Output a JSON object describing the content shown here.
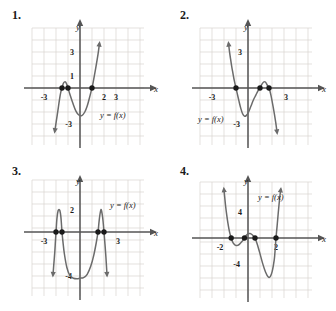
{
  "page": {
    "background": "#ffffff",
    "curve_color": "#6b6b6b",
    "grid_color": "#d9d4d0",
    "axis_color": "#555555",
    "dot_color": "#1a1a1a",
    "text_color": "#1a1a1a"
  },
  "problems": [
    {
      "id": "1",
      "number": "1.",
      "y_axis_label": "y",
      "x_axis_label": "x",
      "function_label": "y = f(x)",
      "x_tick_labels": [
        "-3",
        "2",
        "3"
      ],
      "y_tick_labels": [
        "3",
        "1",
        "-3"
      ],
      "chart_data": {
        "type": "line",
        "title": "Problem 1 polynomial graph",
        "xlabel": "x",
        "ylabel": "y",
        "xlim": [
          -4,
          4
        ],
        "ylim": [
          -4,
          4
        ],
        "grid": true,
        "x_ticks": [
          -3,
          2,
          3
        ],
        "y_ticks": [
          3,
          1,
          -3
        ],
        "zeros": [
          -1.5,
          -1,
          1
        ],
        "zero_marker_count": 3,
        "local_max": {
          "x": -1.25,
          "y": 0.55
        },
        "local_min": {
          "x": 0.1,
          "y": -2.3
        },
        "end_behavior": {
          "left": "down",
          "right": "up"
        },
        "degree": 3,
        "series": [
          {
            "name": "f",
            "points": [
              [
                -2.1,
                -3.6
              ],
              [
                -1.95,
                -2.6
              ],
              [
                -1.8,
                -1.6
              ],
              [
                -1.7,
                -0.9
              ],
              [
                -1.6,
                -0.35
              ],
              [
                -1.5,
                0.0
              ],
              [
                -1.4,
                0.35
              ],
              [
                -1.3,
                0.5
              ],
              [
                -1.2,
                0.5
              ],
              [
                -1.1,
                0.3
              ],
              [
                -1.0,
                0.0
              ],
              [
                -0.85,
                -0.5
              ],
              [
                -0.6,
                -1.25
              ],
              [
                -0.35,
                -1.9
              ],
              [
                -0.1,
                -2.25
              ],
              [
                0.15,
                -2.3
              ],
              [
                0.4,
                -2.0
              ],
              [
                0.6,
                -1.5
              ],
              [
                0.78,
                -0.85
              ],
              [
                0.92,
                -0.3
              ],
              [
                1.0,
                0.0
              ],
              [
                1.12,
                0.6
              ],
              [
                1.3,
                1.6
              ],
              [
                1.5,
                2.8
              ],
              [
                1.62,
                3.7
              ]
            ]
          }
        ]
      }
    },
    {
      "id": "2",
      "number": "2.",
      "y_axis_label": "y",
      "x_axis_label": "x",
      "function_label": "y = f(x)",
      "x_tick_labels": [
        "-3",
        "3"
      ],
      "y_tick_labels": [
        "3",
        "-3"
      ],
      "chart_data": {
        "type": "line",
        "title": "Problem 2 polynomial graph",
        "xlabel": "x",
        "ylabel": "y",
        "xlim": [
          -4,
          4
        ],
        "ylim": [
          -4,
          4
        ],
        "grid": true,
        "x_ticks": [
          -3,
          3
        ],
        "y_ticks": [
          3,
          -3
        ],
        "zeros": [
          -1,
          1,
          1.75
        ],
        "zero_marker_count": 3,
        "local_min": {
          "x": -0.25,
          "y": -2.35
        },
        "local_max": {
          "x": 1.4,
          "y": 0.55
        },
        "end_behavior": {
          "left": "up",
          "right": "down"
        },
        "degree": 3,
        "series": [
          {
            "name": "f",
            "points": [
              [
                -1.62,
                3.7
              ],
              [
                -1.55,
                3.1
              ],
              [
                -1.45,
                2.4
              ],
              [
                -1.35,
                1.75
              ],
              [
                -1.25,
                1.2
              ],
              [
                -1.15,
                0.65
              ],
              [
                -1.05,
                0.2
              ],
              [
                -1.0,
                0.0
              ],
              [
                -0.9,
                -0.45
              ],
              [
                -0.75,
                -1.1
              ],
              [
                -0.6,
                -1.7
              ],
              [
                -0.45,
                -2.15
              ],
              [
                -0.3,
                -2.35
              ],
              [
                -0.15,
                -2.3
              ],
              [
                0.05,
                -2.0
              ],
              [
                0.25,
                -1.5
              ],
              [
                0.45,
                -1.0
              ],
              [
                0.65,
                -0.6
              ],
              [
                0.85,
                -0.2
              ],
              [
                1.0,
                0.0
              ],
              [
                1.15,
                0.3
              ],
              [
                1.3,
                0.5
              ],
              [
                1.45,
                0.5
              ],
              [
                1.6,
                0.25
              ],
              [
                1.75,
                0.0
              ],
              [
                1.9,
                -0.55
              ],
              [
                2.1,
                -1.6
              ],
              [
                2.3,
                -2.8
              ],
              [
                2.42,
                -3.7
              ]
            ]
          }
        ]
      }
    },
    {
      "id": "3",
      "number": "3.",
      "y_axis_label": "y",
      "x_axis_label": "x",
      "function_label": "y = f(x)",
      "x_tick_labels": [
        "-3",
        "3"
      ],
      "y_tick_labels": [
        "2",
        "-4"
      ],
      "chart_data": {
        "type": "line",
        "title": "Problem 3 quartic W-shaped graph",
        "xlabel": "x",
        "ylabel": "y",
        "xlim": [
          -4,
          4
        ],
        "ylim": [
          -5,
          4
        ],
        "grid": true,
        "x_ticks": [
          -3,
          3
        ],
        "y_ticks": [
          2,
          -4
        ],
        "zeros": [
          -2,
          -1.5,
          1.5,
          2
        ],
        "zero_marker_count": 4,
        "local_max_left": {
          "x": -1.75,
          "y": 2.0
        },
        "local_max_right": {
          "x": 1.75,
          "y": 2.0
        },
        "local_min_center": {
          "x": 0,
          "y": -4.0
        },
        "end_behavior": {
          "left": "down",
          "right": "down"
        },
        "degree": 4,
        "series": [
          {
            "name": "f",
            "points": [
              [
                -2.25,
                -3.9
              ],
              [
                -2.18,
                -2.9
              ],
              [
                -2.1,
                -1.8
              ],
              [
                -2.05,
                -0.9
              ],
              [
                -2.0,
                0.0
              ],
              [
                -1.95,
                0.85
              ],
              [
                -1.9,
                1.45
              ],
              [
                -1.82,
                1.95
              ],
              [
                -1.75,
                2.05
              ],
              [
                -1.68,
                1.95
              ],
              [
                -1.6,
                1.45
              ],
              [
                -1.55,
                0.8
              ],
              [
                -1.5,
                0.0
              ],
              [
                -1.42,
                -0.9
              ],
              [
                -1.3,
                -2.0
              ],
              [
                -1.1,
                -3.2
              ],
              [
                -0.85,
                -3.95
              ],
              [
                -0.55,
                -4.2
              ],
              [
                -0.25,
                -4.25
              ],
              [
                0.0,
                -4.2
              ],
              [
                0.3,
                -4.15
              ],
              [
                0.6,
                -3.85
              ],
              [
                0.9,
                -3.1
              ],
              [
                1.15,
                -2.1
              ],
              [
                1.35,
                -1.0
              ],
              [
                1.5,
                0.0
              ],
              [
                1.58,
                0.85
              ],
              [
                1.65,
                1.5
              ],
              [
                1.75,
                2.05
              ],
              [
                1.85,
                1.6
              ],
              [
                1.92,
                1.0
              ],
              [
                2.0,
                0.0
              ],
              [
                2.08,
                -1.1
              ],
              [
                2.16,
                -2.3
              ],
              [
                2.25,
                -3.9
              ]
            ]
          }
        ]
      }
    },
    {
      "id": "4",
      "number": "4.",
      "y_axis_label": "y",
      "x_axis_label": "x",
      "function_label": "y = f(x)",
      "x_tick_labels": [
        "-2",
        "2"
      ],
      "y_tick_labels": [
        "4",
        "-4"
      ],
      "chart_data": {
        "type": "line",
        "title": "Problem 4 quartic graph",
        "xlabel": "x",
        "ylabel": "y",
        "xlim": [
          -4,
          4
        ],
        "ylim": [
          -8,
          8
        ],
        "grid": true,
        "x_ticks": [
          -2,
          2
        ],
        "y_ticks": [
          4,
          -4
        ],
        "zeros": [
          -1.2,
          -0.25,
          0.5,
          2.0
        ],
        "zero_marker_count": 4,
        "local_min_left": {
          "x": -0.75,
          "y": -1.1
        },
        "local_max_mid": {
          "x": 0.1,
          "y": 0.7
        },
        "local_min_right": {
          "x": 1.45,
          "y": -6.1
        },
        "end_behavior": {
          "left": "up",
          "right": "up"
        },
        "degree": 4,
        "series": [
          {
            "name": "f",
            "points": [
              [
                -1.72,
                7.6
              ],
              [
                -1.66,
                6.3
              ],
              [
                -1.6,
                5.0
              ],
              [
                -1.52,
                3.6
              ],
              [
                -1.44,
                2.4
              ],
              [
                -1.36,
                1.4
              ],
              [
                -1.28,
                0.6
              ],
              [
                -1.2,
                0.0
              ],
              [
                -1.1,
                -0.6
              ],
              [
                -1.0,
                -0.95
              ],
              [
                -0.88,
                -1.15
              ],
              [
                -0.75,
                -1.15
              ],
              [
                -0.6,
                -0.95
              ],
              [
                -0.45,
                -0.6
              ],
              [
                -0.32,
                -0.25
              ],
              [
                -0.25,
                0.0
              ],
              [
                -0.15,
                0.35
              ],
              [
                0.0,
                0.65
              ],
              [
                0.15,
                0.7
              ],
              [
                0.3,
                0.5
              ],
              [
                0.42,
                0.2
              ],
              [
                0.5,
                0.0
              ],
              [
                0.65,
                -0.9
              ],
              [
                0.85,
                -2.4
              ],
              [
                1.05,
                -4.0
              ],
              [
                1.25,
                -5.3
              ],
              [
                1.45,
                -6.1
              ],
              [
                1.6,
                -6.0
              ],
              [
                1.72,
                -5.3
              ],
              [
                1.82,
                -4.2
              ],
              [
                1.9,
                -2.9
              ],
              [
                2.0,
                0.0
              ],
              [
                2.08,
                1.9
              ],
              [
                2.16,
                3.9
              ],
              [
                2.26,
                6.2
              ],
              [
                2.34,
                7.6
              ]
            ]
          }
        ]
      }
    }
  ]
}
